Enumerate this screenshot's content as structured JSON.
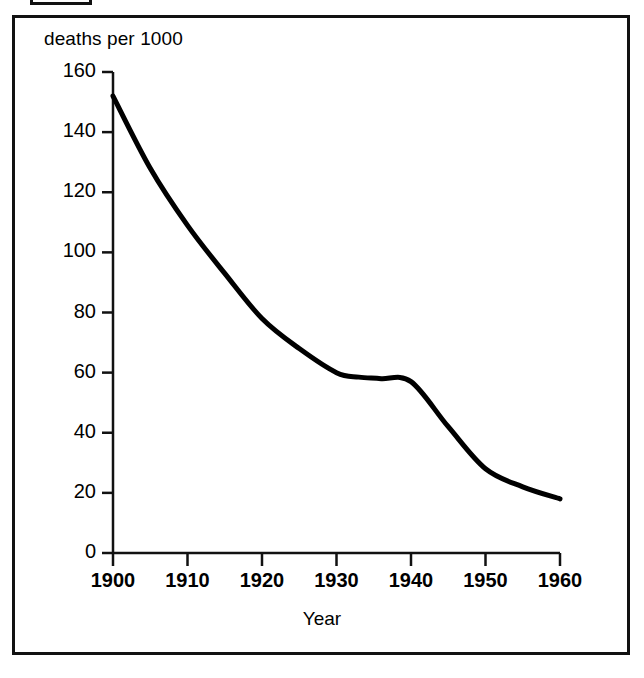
{
  "figure": {
    "frame_color": "#111111",
    "background": "#ffffff"
  },
  "labels": {
    "y_axis_title": "deaths per 1000",
    "x_axis_title": "Year"
  },
  "chart_data": {
    "type": "line",
    "title": "",
    "subtitle": "",
    "xlabel": "Year",
    "ylabel": "deaths per 1000",
    "xlim": [
      1900,
      1960
    ],
    "ylim": [
      0,
      160
    ],
    "grid": false,
    "legend": "none",
    "line_color": "#000000",
    "line_width": 5,
    "x_ticks": [
      1900,
      1910,
      1920,
      1930,
      1940,
      1950,
      1960
    ],
    "x_tick_labels": [
      "1900",
      "1910",
      "1920",
      "1930",
      "1940",
      "1950",
      "1960"
    ],
    "y_ticks": [
      0,
      20,
      40,
      60,
      80,
      100,
      120,
      140,
      160
    ],
    "y_tick_labels": [
      "0",
      "20",
      "40",
      "60",
      "80",
      "100",
      "120",
      "140",
      "160"
    ],
    "series": [
      {
        "name": "deaths per 1000",
        "x": [
          1900,
          1905,
          1910,
          1915,
          1920,
          1925,
          1930,
          1933,
          1936,
          1940,
          1945,
          1950,
          1955,
          1960
        ],
        "values": [
          152,
          128,
          109,
          93,
          78,
          68,
          60,
          58.5,
          58,
          57,
          42,
          28,
          22,
          18
        ]
      }
    ],
    "annotations": []
  }
}
